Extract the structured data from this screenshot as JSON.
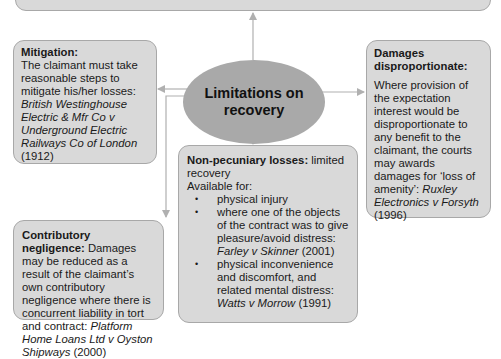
{
  "center": {
    "line1": "Limitations on",
    "line2": "recovery"
  },
  "mitigation": {
    "title": "Mitigation:",
    "text": "The claimant must take reasonable steps to mitigate his/her losses: ",
    "case": "British Westinghouse Electric & Mfr Co v Underground Electric Railways Co of London",
    "year": " (1912)"
  },
  "damages": {
    "title": "Damages disproportionate:",
    "text": "Where provision of the expectation interest would be disproportionate to any benefit to the claimant, the courts may awards damages for ‘loss of amenity’: ",
    "case": "Ruxley Electronics v Forsyth",
    "year": " (1996)"
  },
  "contributory": {
    "title": "Contributory negligence:",
    "text": " Damages may be reduced as a result of the claimant’s own contributory negligence where there is concurrent liability in tort and contract: ",
    "case": "Platform Home Loans Ltd v Oyston Shipways",
    "year": " (2000)"
  },
  "nonpecuniary": {
    "title": "Non-pecuniary losses:",
    "subtitle": " limited recovery",
    "available": "Available for:",
    "items": [
      {
        "text": "physical injury",
        "case": "",
        "year": ""
      },
      {
        "text": "where one of the objects of the contract was to give pleasure/avoid distress: ",
        "case": "Farley v Skinner",
        "year": " (2001)"
      },
      {
        "text": "physical inconvenience and discomfort, and related mental distress: ",
        "case": "Watts v Morrow",
        "year": " (1991)"
      }
    ]
  },
  "colors": {
    "box_fill": "#d9d9d9",
    "box_border": "#a8a8a8",
    "ellipse_fill": "#a9a9a9",
    "connector": "#b0b0b0"
  }
}
